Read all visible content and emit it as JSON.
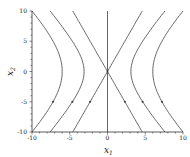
{
  "chart_data": {
    "type": "line",
    "title": "",
    "xlabel": "x1",
    "ylabel": "x2",
    "xlim": [
      -10,
      10
    ],
    "ylim": [
      -10,
      10
    ],
    "x_ticks": [
      "-10",
      "-5",
      "0",
      "5",
      "10"
    ],
    "y_ticks": [
      "10",
      "5",
      "0",
      "-5",
      "-10"
    ],
    "grid": false,
    "legend": null,
    "series": [
      {
        "name": "left-outer",
        "vertex_x1": -6.0,
        "endpoints_x1_at_x2_pm10": -10.0
      },
      {
        "name": "left-mid",
        "vertex_x1": -3.1,
        "endpoints_x1_at_x2_pm10": -7.6
      },
      {
        "name": "left-asymptote",
        "vertex_x1": 0,
        "endpoints_x1_at_x2_pm10": -4.6
      },
      {
        "name": "vertical-axis-line",
        "x1": 0
      },
      {
        "name": "right-asymptote",
        "vertex_x1": 0,
        "endpoints_x1_at_x2_pm10": 4.6
      },
      {
        "name": "right-mid",
        "vertex_x1": 3.1,
        "endpoints_x1_at_x2_pm10": 7.6
      },
      {
        "name": "right-outer",
        "vertex_x1": 6.0,
        "endpoints_x1_at_x2_pm10": 10.0
      }
    ]
  },
  "labels": {
    "xlabel": "x",
    "xlabel_sub": "1",
    "ylabel": "x",
    "ylabel_sub": "2",
    "xt0": "-10",
    "xt1": "-5",
    "xt2": "0",
    "xt3": "5",
    "xt4": "10",
    "yt0": "10",
    "yt1": "5",
    "yt2": "0",
    "yt3": "-5",
    "yt4": "-10"
  }
}
